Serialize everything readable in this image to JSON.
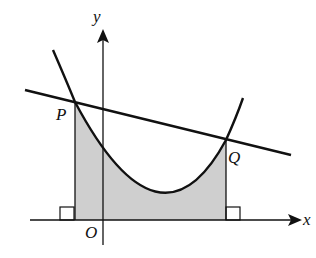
{
  "diagram": {
    "labels": {
      "y_axis": "y",
      "x_axis": "x",
      "origin": "O",
      "point_p": "P",
      "point_q": "Q"
    },
    "colors": {
      "stroke": "#111111",
      "shaded_region": "#cfcfcf",
      "background": "#ffffff"
    }
  }
}
